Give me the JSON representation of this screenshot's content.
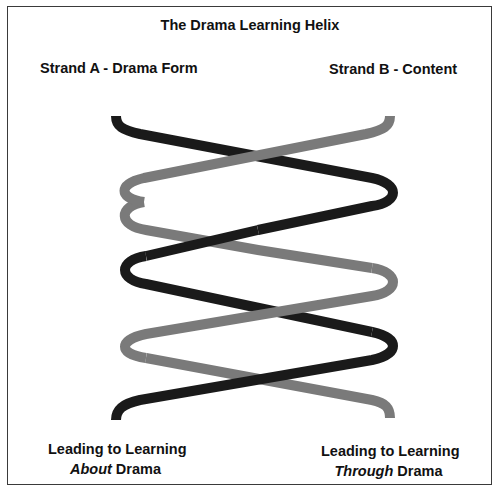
{
  "diagram": {
    "title": "The Drama Learning Helix",
    "strand_a": {
      "label": "Strand A - Drama Form",
      "color": "#1a1a1a"
    },
    "strand_b": {
      "label": "Strand B - Content",
      "color": "#7a7a7a"
    },
    "outcome_left": {
      "line1": "Leading to Learning",
      "line2_emphasis": "About",
      "line2_rest": " Drama"
    },
    "outcome_right": {
      "line1": "Leading to Learning",
      "line2_emphasis": "Through",
      "line2_rest": " Drama"
    },
    "crossings": 4,
    "border_color": "#3a3a3a"
  }
}
